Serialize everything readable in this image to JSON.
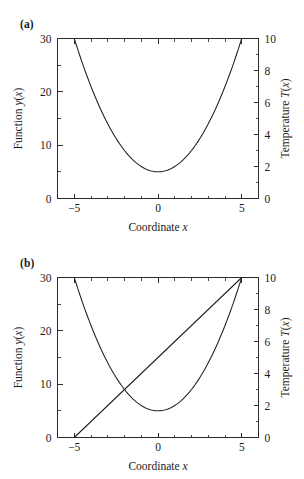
{
  "figure": {
    "page_artifact_text": "· ·",
    "panels": [
      {
        "id": "a",
        "label": "(a)",
        "xlabel": "Coordinate ",
        "xlabel_var": "x",
        "ylabel_left": "Function ",
        "ylabel_left_var": "y",
        "ylabel_left_tail": "(",
        "ylabel_left_var2": "x",
        "ylabel_left_end": ")",
        "ylabel_right": "Temperature ",
        "ylabel_right_var": "T",
        "ylabel_right_tail": "(",
        "ylabel_right_var2": "x",
        "ylabel_right_end": ")"
      },
      {
        "id": "b",
        "label": "(b)",
        "xlabel": "Coordinate ",
        "xlabel_var": "x",
        "ylabel_left": "Function ",
        "ylabel_left_var": "y",
        "ylabel_left_tail": "(",
        "ylabel_left_var2": "x",
        "ylabel_left_end": ")",
        "ylabel_right": "Temperature ",
        "ylabel_right_var": "T",
        "ylabel_right_tail": "(",
        "ylabel_right_var2": "x",
        "ylabel_right_end": ")"
      }
    ]
  },
  "chart_data": [
    {
      "type": "line",
      "panel": "a",
      "title": "(a)",
      "xlabel": "Coordinate x",
      "ylabel": "Function y(x)",
      "ylabel_right": "Temperature T(x)",
      "xlim": [
        -6,
        6
      ],
      "ylim": [
        0,
        30
      ],
      "ylim_right": [
        0,
        10
      ],
      "grid": false,
      "legend": "none",
      "xticks": [
        -5,
        0,
        5
      ],
      "xticklabels": [
        "−5",
        "0",
        "5"
      ],
      "xticks_minor": [
        -6,
        -4,
        -3,
        -2,
        -1,
        1,
        2,
        3,
        4,
        6
      ],
      "yticks": [
        0,
        10,
        20,
        30
      ],
      "yticklabels": [
        "0",
        "10",
        "20",
        "30"
      ],
      "yticks_minor": [
        5,
        15,
        25
      ],
      "yticks_right": [
        0,
        2,
        4,
        6,
        8,
        10
      ],
      "yticklabels_right": [
        "0",
        "2",
        "4",
        "6",
        "8",
        "10"
      ],
      "yticks_right_minor": [
        1,
        3,
        5,
        7,
        9
      ],
      "series": [
        {
          "name": "parabola",
          "formula": "y = x^2 + 5",
          "x": [
            -5,
            -4.5,
            -4,
            -3.5,
            -3,
            -2.5,
            -2,
            -1.5,
            -1,
            -0.5,
            0,
            0.5,
            1,
            1.5,
            2,
            2.5,
            3,
            3.5,
            4,
            4.5,
            5
          ],
          "values": [
            30,
            25.25,
            21,
            17.25,
            14,
            11.25,
            9,
            7.25,
            6,
            5.25,
            5,
            5.25,
            6,
            7.25,
            9,
            11.25,
            14,
            17.25,
            21,
            25.25,
            30
          ]
        }
      ]
    },
    {
      "type": "line",
      "panel": "b",
      "title": "(b)",
      "xlabel": "Coordinate x",
      "ylabel": "Function y(x)",
      "ylabel_right": "Temperature T(x)",
      "xlim": [
        -6,
        6
      ],
      "ylim": [
        0,
        30
      ],
      "ylim_right": [
        0,
        10
      ],
      "grid": false,
      "legend": "none",
      "xticks": [
        -5,
        0,
        5
      ],
      "xticklabels": [
        "−5",
        "0",
        "5"
      ],
      "xticks_minor": [
        -6,
        -4,
        -3,
        -2,
        -1,
        1,
        2,
        3,
        4,
        6
      ],
      "yticks": [
        0,
        10,
        20,
        30
      ],
      "yticklabels": [
        "0",
        "10",
        "20",
        "30"
      ],
      "yticks_minor": [
        5,
        15,
        25
      ],
      "yticks_right": [
        0,
        2,
        4,
        6,
        8,
        10
      ],
      "yticklabels_right": [
        "0",
        "2",
        "4",
        "6",
        "8",
        "10"
      ],
      "yticks_right_minor": [
        1,
        3,
        5,
        7,
        9
      ],
      "series": [
        {
          "name": "parabola",
          "formula": "y = x^2 + 5",
          "x": [
            -5,
            -4.5,
            -4,
            -3.5,
            -3,
            -2.5,
            -2,
            -1.5,
            -1,
            -0.5,
            0,
            0.5,
            1,
            1.5,
            2,
            2.5,
            3,
            3.5,
            4,
            4.5,
            5
          ],
          "values": [
            30,
            25.25,
            21,
            17.25,
            14,
            11.25,
            9,
            7.25,
            6,
            5.25,
            5,
            5.25,
            6,
            7.25,
            9,
            11.25,
            14,
            17.25,
            21,
            25.25,
            30
          ]
        },
        {
          "name": "straight-line",
          "formula": "y = 3x + 15",
          "x": [
            -5,
            5
          ],
          "values": [
            0,
            30
          ]
        }
      ]
    }
  ]
}
